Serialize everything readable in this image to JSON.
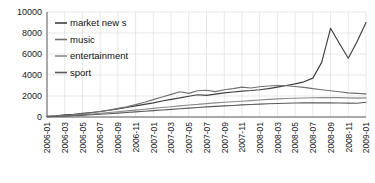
{
  "chart_data": {
    "type": "line",
    "title": "",
    "xlabel": "",
    "ylabel": "",
    "ylim": [
      0,
      10000
    ],
    "ytick_labels": [
      "0",
      "2000",
      "4000",
      "6000",
      "8000",
      "10000"
    ],
    "ytick_values": [
      0,
      2000,
      4000,
      6000,
      8000,
      10000
    ],
    "grid": true,
    "legend_position": "top-left",
    "x": [
      "2006-01",
      "2006-02",
      "2006-03",
      "2006-04",
      "2006-05",
      "2006-06",
      "2006-07",
      "2006-08",
      "2006-09",
      "2006-10",
      "2006-11",
      "2006-12",
      "2007-01",
      "2007-02",
      "2007-03",
      "2007-04",
      "2007-05",
      "2007-06",
      "2007-07",
      "2007-08",
      "2007-09",
      "2007-10",
      "2007-11",
      "2007-12",
      "2008-01",
      "2008-02",
      "2008-03",
      "2008-04",
      "2008-05",
      "2008-06",
      "2008-07",
      "2008-08",
      "2008-09",
      "2008-10",
      "2008-11",
      "2008-12",
      "2009-01"
    ],
    "xtick_labels": [
      "2006-01",
      "2006-03",
      "2006-05",
      "2006-07",
      "2006-09",
      "2006-11",
      "2007-01",
      "2007-03",
      "2007-05",
      "2007-07",
      "2007-09",
      "2007-11",
      "2008-01",
      "2008-03",
      "2008-05",
      "2008-07",
      "2008-09",
      "2008-11",
      "2009-01"
    ],
    "series": [
      {
        "name": "market new s",
        "color": "#3f3f3f",
        "values": [
          60,
          120,
          200,
          260,
          340,
          430,
          520,
          640,
          760,
          900,
          1060,
          1200,
          1340,
          1520,
          1680,
          1820,
          1980,
          2120,
          2060,
          2180,
          2300,
          2380,
          2460,
          2520,
          2600,
          2700,
          2850,
          3000,
          3150,
          3350,
          3700,
          5200,
          8450,
          7000,
          5600,
          7200,
          9000
        ]
      },
      {
        "name": "music",
        "color": "#707070",
        "values": [
          40,
          90,
          150,
          210,
          300,
          400,
          520,
          650,
          820,
          980,
          1180,
          1400,
          1650,
          1900,
          2150,
          2400,
          2250,
          2500,
          2550,
          2420,
          2600,
          2700,
          2850,
          2760,
          2880,
          2950,
          3000,
          2980,
          2900,
          2820,
          2700,
          2600,
          2500,
          2400,
          2300,
          2250,
          2200
        ]
      },
      {
        "name": "entertainment",
        "color": "#8a8a8a",
        "values": [
          30,
          70,
          110,
          160,
          220,
          290,
          360,
          430,
          500,
          580,
          660,
          740,
          820,
          900,
          980,
          1060,
          1140,
          1200,
          1280,
          1340,
          1400,
          1450,
          1500,
          1560,
          1620,
          1680,
          1720,
          1760,
          1790,
          1810,
          1830,
          1840,
          1850,
          1840,
          1820,
          1800,
          1820
        ]
      },
      {
        "name": "sport",
        "color": "#5a5a5a",
        "values": [
          20,
          50,
          80,
          120,
          160,
          210,
          260,
          310,
          370,
          430,
          490,
          550,
          610,
          670,
          730,
          790,
          850,
          900,
          960,
          1010,
          1060,
          1100,
          1150,
          1190,
          1230,
          1260,
          1290,
          1310,
          1330,
          1340,
          1350,
          1350,
          1340,
          1330,
          1320,
          1310,
          1400
        ]
      }
    ]
  }
}
